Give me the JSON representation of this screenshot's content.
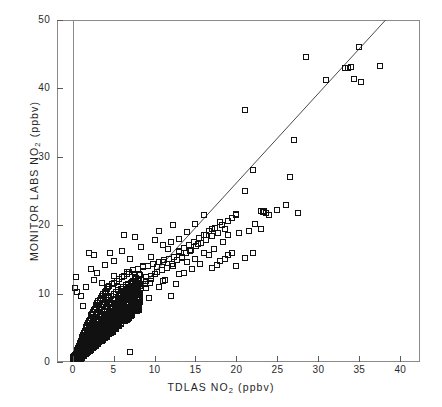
{
  "chart_data": {
    "type": "scatter",
    "title": "",
    "xlabel": "TDLAS NO2 (ppbv)",
    "ylabel": "MONITOR LABS NO2 (ppbv)",
    "xlabel_pre": "TDLAS NO",
    "xlabel_sub": "2",
    "xlabel_post": " (ppbv)",
    "ylabel_pre": "MONITOR LABS NO",
    "ylabel_sub": "2",
    "ylabel_post": " (ppbv)",
    "xlim": [
      -1.9,
      42.4
    ],
    "ylim": [
      0,
      50
    ],
    "xticks": [
      0,
      5,
      10,
      15,
      20,
      25,
      30,
      35,
      40
    ],
    "yticks": [
      0,
      10,
      20,
      30,
      40,
      50
    ],
    "xtick_labels": [
      "0",
      "5",
      "10",
      "15",
      "20",
      "25",
      "30",
      "35",
      "40"
    ],
    "ytick_labels": [
      "0",
      "10",
      "20",
      "30",
      "40",
      "50"
    ],
    "grid": false,
    "legend": null,
    "marker": "open-square",
    "marker_color": "#111111",
    "fit_line": {
      "type": "linear-regression",
      "color": "#4a4a4a",
      "x_start": 0.0,
      "y_start": 0.0,
      "x_end": 38.2,
      "y_end": 50.0,
      "slope": 1.309,
      "intercept": 0.0
    },
    "points": [
      [
        0.15,
        0.2
      ],
      [
        0.2,
        0.5
      ],
      [
        0.25,
        0.3
      ],
      [
        0.3,
        0.8
      ],
      [
        0.35,
        0.4
      ],
      [
        0.4,
        1.1
      ],
      [
        0.45,
        0.6
      ],
      [
        0.5,
        1.4
      ],
      [
        0.5,
        0.3
      ],
      [
        0.55,
        0.9
      ],
      [
        0.6,
        1.8
      ],
      [
        0.6,
        0.5
      ],
      [
        0.65,
        1.2
      ],
      [
        0.7,
        2.1
      ],
      [
        0.7,
        0.7
      ],
      [
        0.75,
        1.5
      ],
      [
        0.8,
        2.4
      ],
      [
        0.8,
        1.0
      ],
      [
        0.85,
        1.8
      ],
      [
        0.9,
        2.8
      ],
      [
        0.9,
        1.3
      ],
      [
        0.95,
        2.0
      ],
      [
        1.0,
        3.1
      ],
      [
        1.0,
        1.5
      ],
      [
        1.05,
        2.3
      ],
      [
        1.1,
        3.4
      ],
      [
        1.1,
        1.8
      ],
      [
        1.15,
        2.6
      ],
      [
        1.2,
        3.7
      ],
      [
        1.2,
        2.0
      ],
      [
        1.25,
        2.9
      ],
      [
        1.3,
        4.0
      ],
      [
        1.3,
        2.2
      ],
      [
        1.35,
        3.2
      ],
      [
        1.4,
        4.3
      ],
      [
        1.4,
        2.5
      ],
      [
        1.45,
        3.4
      ],
      [
        1.5,
        4.6
      ],
      [
        1.5,
        2.7
      ],
      [
        1.55,
        3.7
      ],
      [
        1.6,
        4.9
      ],
      [
        1.6,
        3.0
      ],
      [
        1.65,
        3.9
      ],
      [
        1.7,
        5.1
      ],
      [
        1.7,
        3.2
      ],
      [
        1.75,
        4.2
      ],
      [
        1.8,
        5.4
      ],
      [
        1.8,
        3.5
      ],
      [
        1.85,
        4.4
      ],
      [
        1.9,
        5.7
      ],
      [
        1.9,
        3.7
      ],
      [
        1.95,
        4.7
      ],
      [
        2.0,
        6.0
      ],
      [
        2.0,
        4.0
      ],
      [
        2.05,
        4.9
      ],
      [
        2.1,
        6.2
      ],
      [
        2.1,
        4.2
      ],
      [
        2.15,
        5.2
      ],
      [
        2.2,
        6.5
      ],
      [
        2.2,
        4.4
      ],
      [
        2.25,
        5.4
      ],
      [
        2.3,
        6.8
      ],
      [
        2.3,
        4.7
      ],
      [
        2.35,
        5.7
      ],
      [
        2.4,
        7.0
      ],
      [
        2.4,
        4.9
      ],
      [
        2.45,
        5.9
      ],
      [
        2.5,
        7.3
      ],
      [
        2.5,
        5.2
      ],
      [
        2.55,
        6.1
      ],
      [
        2.6,
        7.6
      ],
      [
        2.6,
        5.4
      ],
      [
        2.65,
        6.4
      ],
      [
        2.7,
        7.8
      ],
      [
        2.7,
        5.6
      ],
      [
        2.75,
        6.6
      ],
      [
        2.8,
        8.1
      ],
      [
        2.8,
        5.9
      ],
      [
        2.85,
        6.9
      ],
      [
        2.9,
        8.4
      ],
      [
        2.9,
        6.1
      ],
      [
        2.95,
        7.1
      ],
      [
        3.0,
        8.6
      ],
      [
        3.0,
        6.3
      ],
      [
        3.1,
        7.3
      ],
      [
        3.15,
        8.9
      ],
      [
        3.2,
        6.6
      ],
      [
        3.25,
        7.6
      ],
      [
        3.3,
        9.1
      ],
      [
        3.35,
        6.8
      ],
      [
        3.4,
        7.8
      ],
      [
        3.45,
        9.4
      ],
      [
        3.5,
        7.0
      ],
      [
        3.55,
        8.1
      ],
      [
        3.6,
        9.6
      ],
      [
        3.65,
        7.3
      ],
      [
        3.7,
        8.3
      ],
      [
        3.75,
        9.9
      ],
      [
        3.8,
        7.5
      ],
      [
        3.85,
        8.5
      ],
      [
        3.9,
        10.1
      ],
      [
        3.95,
        7.8
      ],
      [
        4.0,
        8.8
      ],
      [
        4.05,
        10.4
      ],
      [
        4.1,
        8.0
      ],
      [
        4.15,
        9.0
      ],
      [
        4.2,
        10.6
      ],
      [
        4.25,
        8.2
      ],
      [
        4.3,
        9.3
      ],
      [
        4.35,
        10.9
      ],
      [
        4.4,
        8.5
      ],
      [
        4.45,
        9.5
      ],
      [
        4.5,
        11.1
      ],
      [
        4.6,
        8.7
      ],
      [
        4.7,
        9.7
      ],
      [
        4.8,
        11.4
      ],
      [
        4.9,
        9.0
      ],
      [
        5.0,
        10.0
      ],
      [
        5.1,
        11.6
      ],
      [
        5.2,
        9.2
      ],
      [
        5.3,
        10.2
      ],
      [
        5.4,
        11.9
      ],
      [
        5.5,
        9.4
      ],
      [
        5.6,
        10.5
      ],
      [
        5.7,
        12.1
      ],
      [
        5.8,
        9.7
      ],
      [
        5.9,
        10.7
      ],
      [
        6.0,
        12.4
      ],
      [
        6.1,
        9.9
      ],
      [
        6.2,
        10.9
      ],
      [
        6.3,
        12.6
      ],
      [
        6.4,
        10.2
      ],
      [
        6.5,
        11.2
      ],
      [
        6.6,
        12.9
      ],
      [
        6.7,
        10.4
      ],
      [
        6.8,
        11.4
      ],
      [
        6.9,
        13.1
      ],
      [
        7.0,
        10.6
      ],
      [
        7.2,
        11.7
      ],
      [
        7.4,
        13.4
      ],
      [
        7.6,
        10.9
      ],
      [
        7.8,
        11.9
      ],
      [
        8.0,
        13.6
      ],
      [
        8.2,
        11.1
      ],
      [
        8.4,
        12.1
      ],
      [
        8.6,
        13.9
      ],
      [
        8.8,
        11.4
      ],
      [
        9.0,
        12.4
      ],
      [
        9.2,
        14.1
      ],
      [
        9.4,
        11.6
      ],
      [
        9.6,
        12.6
      ],
      [
        9.8,
        14.4
      ],
      [
        10.0,
        12.9
      ],
      [
        10.3,
        13.2
      ],
      [
        10.6,
        14.6
      ],
      [
        10.9,
        13.4
      ],
      [
        11.2,
        14.9
      ],
      [
        11.5,
        13.7
      ],
      [
        11.8,
        15.1
      ],
      [
        12.1,
        14.4
      ],
      [
        12.4,
        15.4
      ],
      [
        12.7,
        14.9
      ],
      [
        13.0,
        16.1
      ],
      [
        13.3,
        15.4
      ],
      [
        13.6,
        16.6
      ],
      [
        13.9,
        15.9
      ],
      [
        14.2,
        17.1
      ],
      [
        14.5,
        16.4
      ],
      [
        14.8,
        17.6
      ],
      [
        15.1,
        16.9
      ],
      [
        15.4,
        18.1
      ],
      [
        15.7,
        17.4
      ],
      [
        16.0,
        18.6
      ],
      [
        16.3,
        17.9
      ],
      [
        16.6,
        19.1
      ],
      [
        17.0,
        18.4
      ],
      [
        17.4,
        19.6
      ],
      [
        17.8,
        18.9
      ],
      [
        18.2,
        20.1
      ],
      [
        18.6,
        19.4
      ],
      [
        19.0,
        20.6
      ],
      [
        19.5,
        21.1
      ],
      [
        20.0,
        21.6
      ],
      [
        0.4,
        12.5
      ],
      [
        0.3,
        10.8
      ],
      [
        0.5,
        10.2
      ],
      [
        1.0,
        9.6
      ],
      [
        1.3,
        8.2
      ],
      [
        2.0,
        16.0
      ],
      [
        2.6,
        15.6
      ],
      [
        3.3,
        8.9
      ],
      [
        3.6,
        11.5
      ],
      [
        4.0,
        10.3
      ],
      [
        4.3,
        9.3
      ],
      [
        4.6,
        8.6
      ],
      [
        5.0,
        12.6
      ],
      [
        5.3,
        9.9
      ],
      [
        5.6,
        11.0
      ],
      [
        6.0,
        10.4
      ],
      [
        6.6,
        13.2
      ],
      [
        7.0,
        1.4
      ],
      [
        7.3,
        9.2
      ],
      [
        7.6,
        12.9
      ],
      [
        8.0,
        10.2
      ],
      [
        8.6,
        14.1
      ],
      [
        9.0,
        11.8
      ],
      [
        9.3,
        9.4
      ],
      [
        9.6,
        12.2
      ],
      [
        10.0,
        17.9
      ],
      [
        10.3,
        13.9
      ],
      [
        10.6,
        10.9
      ],
      [
        11.0,
        14.6
      ],
      [
        11.3,
        12.0
      ],
      [
        11.6,
        16.5
      ],
      [
        12.0,
        9.6
      ],
      [
        12.3,
        14.0
      ],
      [
        12.6,
        11.4
      ],
      [
        13.0,
        18.0
      ],
      [
        13.3,
        15.2
      ],
      [
        13.6,
        13.0
      ],
      [
        14.0,
        19.0
      ],
      [
        14.3,
        16.2
      ],
      [
        14.6,
        13.6
      ],
      [
        15.0,
        20.2
      ],
      [
        15.3,
        17.2
      ],
      [
        15.6,
        14.4
      ],
      [
        16.0,
        21.5
      ],
      [
        16.3,
        18.5
      ],
      [
        16.6,
        15.6
      ],
      [
        17.0,
        19.5
      ],
      [
        17.3,
        16.5
      ],
      [
        17.6,
        14.2
      ],
      [
        18.0,
        20.5
      ],
      [
        18.3,
        17.5
      ],
      [
        18.6,
        15.0
      ],
      [
        19.0,
        18.5
      ],
      [
        19.4,
        16.0
      ],
      [
        20.0,
        21.5
      ],
      [
        20.3,
        18.9
      ],
      [
        21.0,
        36.8
      ],
      [
        21.0,
        25.0
      ],
      [
        21.5,
        19.2
      ],
      [
        22.0,
        28.0
      ],
      [
        22.3,
        20.2
      ],
      [
        23.0,
        22.1
      ],
      [
        23.2,
        22.0
      ],
      [
        23.4,
        22.1
      ],
      [
        23.6,
        21.8
      ],
      [
        23.0,
        19.5
      ],
      [
        24.0,
        21.5
      ],
      [
        25.0,
        22.2
      ],
      [
        26.0,
        23.0
      ],
      [
        26.5,
        27.0
      ],
      [
        27.0,
        32.5
      ],
      [
        27.5,
        21.8
      ],
      [
        28.5,
        44.6
      ],
      [
        30.9,
        41.2
      ],
      [
        33.3,
        43.0
      ],
      [
        33.6,
        43.0
      ],
      [
        34.0,
        43.2
      ],
      [
        34.3,
        41.4
      ],
      [
        35.0,
        46.0
      ],
      [
        35.2,
        41.0
      ],
      [
        37.5,
        43.3
      ],
      [
        12.0,
        17.6
      ],
      [
        12.3,
        20.0
      ],
      [
        13.0,
        16.2
      ],
      [
        6.3,
        18.5
      ],
      [
        7.6,
        18.3
      ],
      [
        5.0,
        14.8
      ],
      [
        4.6,
        16.0
      ],
      [
        3.0,
        13.0
      ],
      [
        2.3,
        13.6
      ],
      [
        1.6,
        11.0
      ],
      [
        8.3,
        16.8
      ],
      [
        9.6,
        15.4
      ],
      [
        10.6,
        19.1
      ],
      [
        11.0,
        17.1
      ],
      [
        7.0,
        15.0
      ],
      [
        6.0,
        16.2
      ],
      [
        4.0,
        14.2
      ],
      [
        2.6,
        12.0
      ],
      [
        14.0,
        14.6
      ],
      [
        15.0,
        15.0
      ],
      [
        16.0,
        16.0
      ],
      [
        18.0,
        14.8
      ],
      [
        19.0,
        15.6
      ],
      [
        21.0,
        15.2
      ],
      [
        22.0,
        16.0
      ],
      [
        17.0,
        13.8
      ],
      [
        20.0,
        14.0
      ],
      [
        13.0,
        12.8
      ],
      [
        11.0,
        11.8
      ],
      [
        9.0,
        10.8
      ]
    ]
  }
}
